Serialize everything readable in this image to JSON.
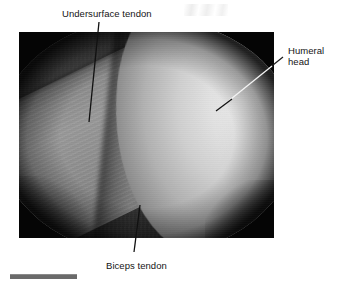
{
  "figure": {
    "type": "arthroscopic-photograph",
    "photo": {
      "left": 19,
      "top": 32,
      "width": 255,
      "height": 206,
      "background_color": "#050505"
    },
    "scale_bar": {
      "name": "scale-bar",
      "color": "#6a6a6a",
      "left": 10,
      "top": 274,
      "width": 67,
      "height": 4
    }
  },
  "annotations": [
    {
      "id": "undersurface-tendon",
      "label": "Undersurface tendon",
      "label_x": 62,
      "label_y": 8,
      "leader": {
        "x1": 99,
        "y1": 22,
        "x2": 89,
        "y2": 122,
        "color": "#111111"
      }
    },
    {
      "id": "humeral-head",
      "label_line_1": "Humeral",
      "label_line_2": "head",
      "label_x": 288,
      "label_y": 45,
      "leader": {
        "x1": 283,
        "y1": 57,
        "x2": 216,
        "y2": 111,
        "color": "#111111"
      },
      "leader_over_dark_color": "#f2f2f2"
    },
    {
      "id": "biceps-tendon",
      "label": "Biceps tendon",
      "label_x": 106,
      "label_y": 260,
      "leader": {
        "x1": 140,
        "y1": 205,
        "x2": 134,
        "y2": 252,
        "color": "#111111"
      }
    }
  ],
  "structures": [
    {
      "name": "rotator-cuff-undersurface",
      "tone": "#3e3e3e",
      "position": "left"
    },
    {
      "name": "biceps-tendon-band",
      "tone": "#909090",
      "position": "lower-center"
    },
    {
      "name": "humeral-head-cartilage",
      "tone": "#e2e2e2",
      "position": "right"
    }
  ],
  "colors": {
    "page_background": "#ffffff",
    "text": "#141414",
    "leader_line": "#111111",
    "scale_bar": "#6a6a6a"
  }
}
